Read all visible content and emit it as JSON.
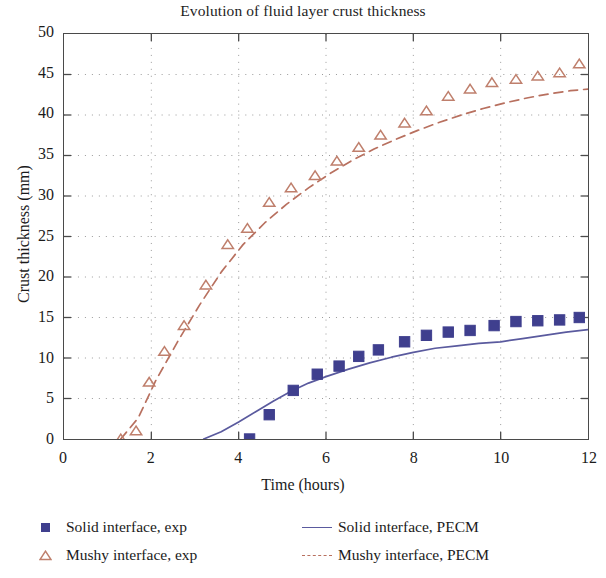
{
  "chart_data": {
    "type": "scatter",
    "title": "Evolution of fluid layer crust thickness",
    "xlabel": "Time (hours)",
    "ylabel": "Crust thickness (mm)",
    "xlim": [
      0,
      12
    ],
    "ylim": [
      0,
      50
    ],
    "xticks": [
      0,
      2,
      4,
      6,
      8,
      10,
      12
    ],
    "yticks": [
      0,
      5,
      10,
      15,
      20,
      25,
      30,
      35,
      40,
      45,
      50
    ],
    "xtick_labels": [
      "0",
      "2",
      "4",
      "6",
      "8",
      "10",
      "12"
    ],
    "ytick_labels": [
      "0",
      "5",
      "10",
      "15",
      "20",
      "25",
      "30",
      "35",
      "40",
      "45",
      "50"
    ],
    "grid": true,
    "grid_style": "dotted",
    "legend_position": "below",
    "colors": {
      "solid_exp": "#3f3f8e",
      "solid_pecm": "#5a5a9e",
      "mushy_exp": "#bf7f6c",
      "mushy_pecm": "#b8705f",
      "axis": "#4a4a4a",
      "grid": "#9a9a9a",
      "text": "#1b1b1b",
      "background": "#ffffff"
    },
    "series": [
      {
        "name": "Solid interface, exp",
        "kind": "scatter",
        "marker": "filled-square",
        "color": "#3f3f8e",
        "x": [
          4.25,
          4.7,
          5.25,
          5.8,
          6.3,
          6.75,
          7.2,
          7.8,
          8.3,
          8.8,
          9.3,
          9.85,
          10.35,
          10.85,
          11.35,
          11.8
        ],
        "y": [
          0.0,
          3.0,
          6.0,
          8.0,
          9.0,
          10.2,
          11.0,
          12.0,
          12.8,
          13.2,
          13.4,
          14.0,
          14.5,
          14.6,
          14.7,
          15.0
        ]
      },
      {
        "name": "Mushy interface, exp",
        "kind": "scatter",
        "marker": "open-triangle",
        "color": "#bf7f6c",
        "x": [
          1.3,
          1.65,
          1.95,
          2.3,
          2.75,
          3.25,
          3.75,
          4.2,
          4.7,
          5.2,
          5.75,
          6.25,
          6.75,
          7.25,
          7.8,
          8.3,
          8.8,
          9.3,
          9.8,
          10.35,
          10.85,
          11.35,
          11.8
        ],
        "y": [
          0.0,
          1.0,
          7.0,
          10.8,
          14.0,
          19.0,
          24.0,
          26.0,
          29.2,
          31.0,
          32.5,
          34.3,
          36.0,
          37.5,
          39.0,
          40.5,
          42.3,
          43.2,
          44.0,
          44.4,
          44.8,
          45.2,
          46.3
        ]
      },
      {
        "name": "Solid interface, PECM",
        "kind": "line",
        "style": "solid",
        "color": "#5a5a9e",
        "x": [
          3.2,
          3.6,
          4.0,
          4.4,
          4.8,
          5.2,
          5.6,
          6.0,
          6.5,
          7.0,
          7.5,
          8.0,
          8.5,
          9.0,
          9.5,
          10.0,
          10.5,
          11.0,
          11.5,
          12.0
        ],
        "y": [
          0.0,
          0.9,
          2.1,
          3.4,
          4.7,
          5.9,
          6.9,
          7.7,
          8.6,
          9.4,
          10.1,
          10.7,
          11.2,
          11.5,
          11.8,
          12.0,
          12.4,
          12.8,
          13.2,
          13.5
        ]
      },
      {
        "name": "Mushy interface, PECM",
        "kind": "line",
        "style": "dashed",
        "color": "#b8705f",
        "x": [
          1.3,
          1.7,
          2.1,
          2.6,
          3.1,
          3.6,
          4.1,
          4.6,
          5.1,
          5.6,
          6.1,
          6.6,
          7.1,
          7.6,
          8.1,
          8.6,
          9.1,
          9.6,
          10.1,
          10.6,
          11.1,
          11.6,
          12.0
        ],
        "y": [
          0.0,
          2.6,
          7.2,
          12.0,
          16.5,
          20.6,
          24.0,
          26.7,
          29.0,
          31.0,
          32.8,
          34.4,
          35.8,
          37.0,
          38.1,
          39.1,
          40.0,
          40.8,
          41.5,
          42.1,
          42.6,
          43.0,
          43.2
        ]
      }
    ]
  },
  "legend": {
    "entries": [
      {
        "label": "Solid interface, exp",
        "key": "filled-square"
      },
      {
        "label": "Mushy interface, exp",
        "key": "open-triangle"
      },
      {
        "label": "Solid interface, PECM",
        "key": "solid-line"
      },
      {
        "label": "Mushy interface, PECM",
        "key": "dashed-line"
      }
    ]
  }
}
